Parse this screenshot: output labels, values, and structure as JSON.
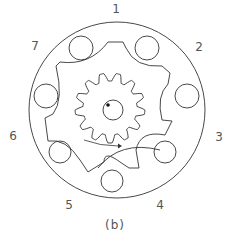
{
  "diagram": {
    "caption": "(b)",
    "stroke_color": "#333333",
    "label_color": "#555555",
    "outer_ring": {
      "cx": 117,
      "cy": 110,
      "r": 88
    },
    "port_labels": [
      {
        "id": "1",
        "text": "1",
        "x": 116,
        "y": 9
      },
      {
        "id": "2",
        "text": "2",
        "x": 199,
        "y": 47
      },
      {
        "id": "3",
        "text": "3",
        "x": 219,
        "y": 137
      },
      {
        "id": "4",
        "text": "4",
        "x": 160,
        "y": 205
      },
      {
        "id": "5",
        "text": "5",
        "x": 69,
        "y": 205
      },
      {
        "id": "6",
        "text": "6",
        "x": 13,
        "y": 136
      },
      {
        "id": "7",
        "text": "7",
        "x": 35,
        "y": 46
      }
    ],
    "holes": [
      {
        "cx": 81,
        "cy": 48,
        "r": 12
      },
      {
        "cx": 147,
        "cy": 48,
        "r": 12
      },
      {
        "cx": 187,
        "cy": 96,
        "r": 12
      },
      {
        "cx": 165,
        "cy": 152,
        "r": 11
      },
      {
        "cx": 112,
        "cy": 181,
        "r": 11
      },
      {
        "cx": 60,
        "cy": 152,
        "r": 11
      },
      {
        "cx": 46,
        "cy": 96,
        "r": 12
      }
    ],
    "gear": {
      "cx": 110,
      "cy": 108,
      "teeth": 13,
      "outer_r": 35,
      "inner_r": 27
    },
    "shaft": {
      "cx": 113,
      "cy": 110,
      "r": 10,
      "dot_x": 108,
      "dot_y": 105
    }
  }
}
